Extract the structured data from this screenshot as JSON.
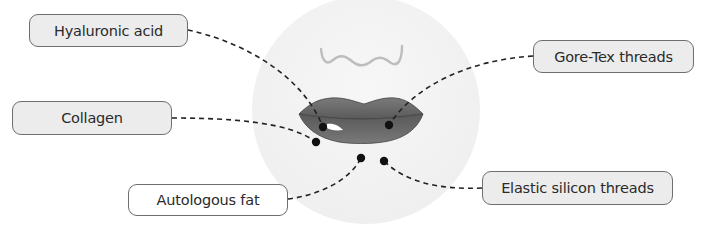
{
  "diagram": {
    "colors": {
      "face_background": "#f3f3f3",
      "lip_fill": "#6a6a6a",
      "lip_dark": "#4a4a4a",
      "label_fill_gray": "#ececec",
      "label_fill_white": "#ffffff",
      "label_border": "#6e6e6e",
      "leader_line": "#222222",
      "dot": "#111111",
      "nose_line": "#bdbdbd"
    },
    "labels": [
      {
        "id": "hyaluronic-acid",
        "text": "Hyaluronic acid",
        "fill": "gray"
      },
      {
        "id": "gore-tex-threads",
        "text": "Gore-Tex threads",
        "fill": "gray"
      },
      {
        "id": "collagen",
        "text": "Collagen",
        "fill": "gray"
      },
      {
        "id": "autologous-fat",
        "text": "Autologous fat",
        "fill": "white"
      },
      {
        "id": "elastic-silicon-threads",
        "text": "Elastic silicon threads",
        "fill": "gray"
      }
    ]
  }
}
